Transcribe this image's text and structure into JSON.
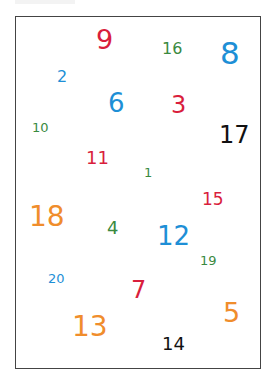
{
  "colors": {
    "red": "#d91e3c",
    "blue": "#1e8fd6",
    "green": "#3a8a3f",
    "orange": "#f08d2c",
    "black": "#111111"
  },
  "numbers": [
    {
      "value": "9",
      "color": "red",
      "x": 96,
      "y": 26,
      "size": 27
    },
    {
      "value": "16",
      "color": "green",
      "x": 162,
      "y": 41,
      "size": 16
    },
    {
      "value": "8",
      "color": "blue",
      "x": 220,
      "y": 38,
      "size": 31
    },
    {
      "value": "2",
      "color": "blue",
      "x": 57,
      "y": 69,
      "size": 16
    },
    {
      "value": "6",
      "color": "blue",
      "x": 108,
      "y": 90,
      "size": 26
    },
    {
      "value": "3",
      "color": "red",
      "x": 171,
      "y": 93,
      "size": 24
    },
    {
      "value": "10",
      "color": "green",
      "x": 32,
      "y": 121,
      "size": 13
    },
    {
      "value": "17",
      "color": "black",
      "x": 219,
      "y": 123,
      "size": 24
    },
    {
      "value": "11",
      "color": "red",
      "x": 86,
      "y": 149,
      "size": 18
    },
    {
      "value": "1",
      "color": "green",
      "x": 144,
      "y": 166,
      "size": 13
    },
    {
      "value": "15",
      "color": "red",
      "x": 202,
      "y": 191,
      "size": 17
    },
    {
      "value": "18",
      "color": "orange",
      "x": 29,
      "y": 203,
      "size": 28
    },
    {
      "value": "4",
      "color": "green",
      "x": 107,
      "y": 219,
      "size": 18
    },
    {
      "value": "12",
      "color": "blue",
      "x": 157,
      "y": 223,
      "size": 26
    },
    {
      "value": "19",
      "color": "green",
      "x": 200,
      "y": 254,
      "size": 13
    },
    {
      "value": "20",
      "color": "blue",
      "x": 48,
      "y": 272,
      "size": 13
    },
    {
      "value": "7",
      "color": "red",
      "x": 131,
      "y": 278,
      "size": 24
    },
    {
      "value": "5",
      "color": "orange",
      "x": 223,
      "y": 299,
      "size": 27
    },
    {
      "value": "13",
      "color": "orange",
      "x": 72,
      "y": 313,
      "size": 28
    },
    {
      "value": "14",
      "color": "black",
      "x": 162,
      "y": 335,
      "size": 18
    }
  ]
}
